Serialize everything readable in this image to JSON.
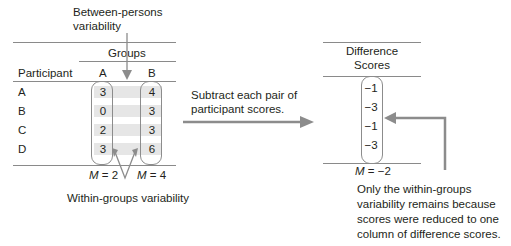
{
  "annotations": {
    "between_persons": [
      "Between-persons",
      "variability"
    ],
    "within_groups": "Within-groups variability",
    "subtract": [
      "Subtract each pair of",
      "participant scores."
    ],
    "only_within": [
      "Only the within-groups",
      "variability remains because",
      "scores were reduced to one",
      "column of difference scores."
    ]
  },
  "left_table": {
    "group_header": "Groups",
    "col_participant": "Participant",
    "col_a": "A",
    "col_b": "B",
    "rows": [
      {
        "participant": "A",
        "a": "3",
        "b": "4"
      },
      {
        "participant": "B",
        "a": "0",
        "b": "3"
      },
      {
        "participant": "C",
        "a": "2",
        "b": "3"
      },
      {
        "participant": "D",
        "a": "3",
        "b": "6"
      }
    ],
    "mean_a_label": "M",
    "mean_a_value": " = 2",
    "mean_b_label": "M",
    "mean_b_value": " = 4"
  },
  "right_table": {
    "header_line1": "Difference",
    "header_line2": "Scores",
    "values": [
      "−1",
      "−3",
      "−1",
      "−3"
    ],
    "mean_label": "M",
    "mean_value": " = −2"
  },
  "colors": {
    "arrow": "#8c8c8c",
    "rule": "#8a8a8a",
    "shade": "#e6e6e6",
    "text": "#231f20"
  }
}
